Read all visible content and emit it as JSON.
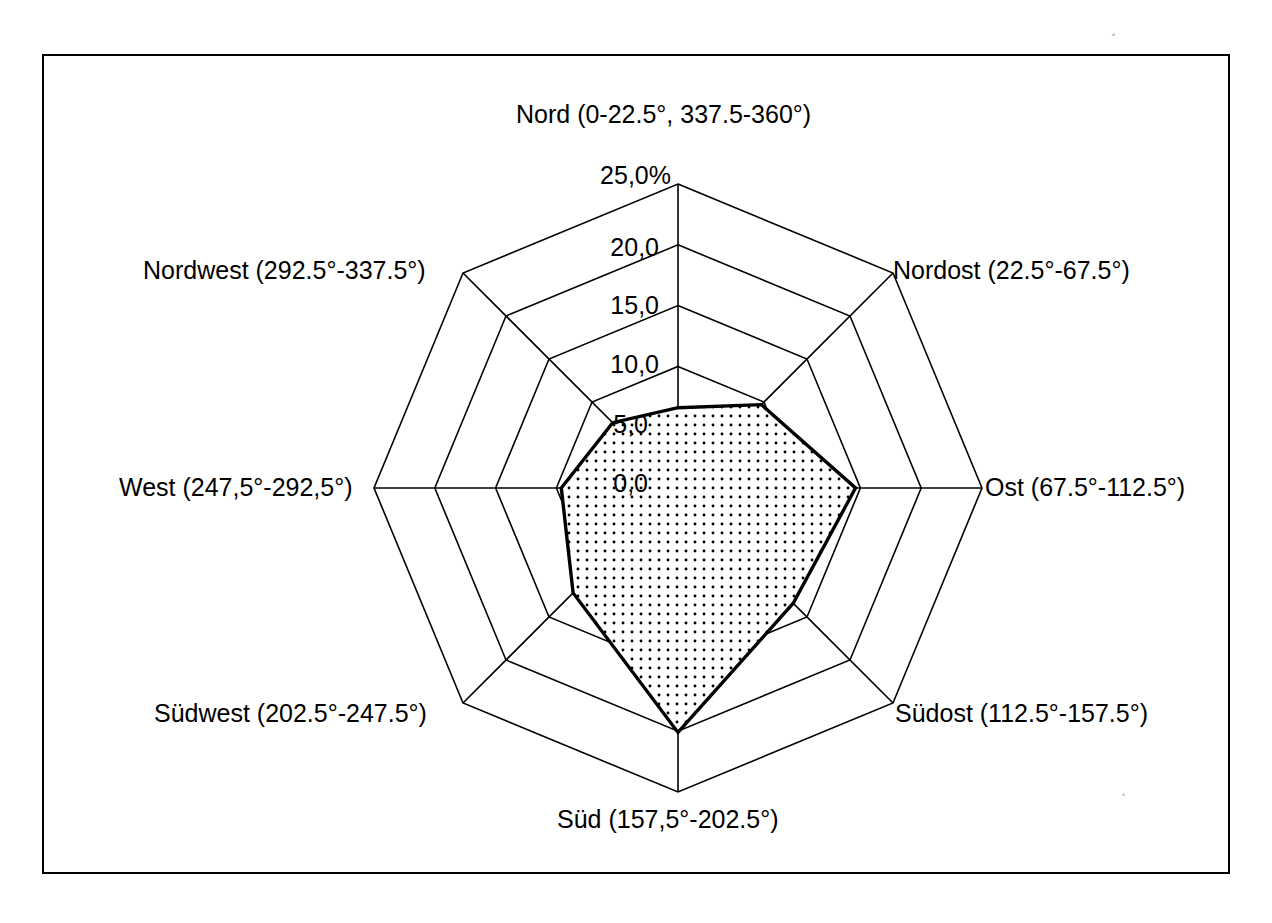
{
  "chart_data": {
    "type": "radar",
    "title": "",
    "unit": "%",
    "categories": [
      "Nord (0-22.5°, 337.5-360°)",
      "Nordost (22.5°-67.5°)",
      "Ost (67.5°-112.5°)",
      "Südost (112.5°-157.5°)",
      "Süd (157,5°-202.5°)",
      "Südwest (202.5°-247.5°)",
      "West (247,5°-292,5°)",
      "Nordwest (292.5°-337.5°)"
    ],
    "values": [
      6.6,
      9.7,
      14.6,
      13.4,
      20.1,
      12.2,
      9.6,
      7.6
    ],
    "series": [
      {
        "name": "Windrichtungsverteilung",
        "values": [
          6.6,
          9.7,
          14.6,
          13.4,
          20.1,
          12.2,
          9.6,
          7.6
        ]
      }
    ],
    "rlim": [
      0.0,
      25.0
    ],
    "rticks": [
      0.0,
      5.0,
      10.0,
      15.0,
      20.0,
      25.0
    ],
    "rtick_labels": [
      "0,0",
      "5,0",
      "10,0",
      "15,0",
      "20,0",
      "25,0%"
    ],
    "grid": true,
    "gridlines": "polygon",
    "legend": "none",
    "fill_pattern": "dotted",
    "fill_color": "#ffffff",
    "pattern_dot_color": "#000000",
    "line_color": "#000000",
    "grid_color": "#000000",
    "background_color": "#ffffff"
  },
  "axis_labels": {
    "north": "Nord (0-22.5°, 337.5-360°)",
    "northeast": "Nordost (22.5°-67.5°)",
    "east": "Ost (67.5°-112.5°)",
    "southeast": "Südost (112.5°-157.5°)",
    "south": "Süd (157,5°-202.5°)",
    "southwest": "Südwest (202.5°-247.5°)",
    "west": "West (247,5°-292,5°)",
    "northwest": "Nordwest (292.5°-337.5°)"
  },
  "radial_ticks": {
    "t25": "25,0%",
    "t20": "20,0",
    "t15": "15,0",
    "t10": "10,0",
    "t5": "5,0",
    "t0": "0,0"
  }
}
